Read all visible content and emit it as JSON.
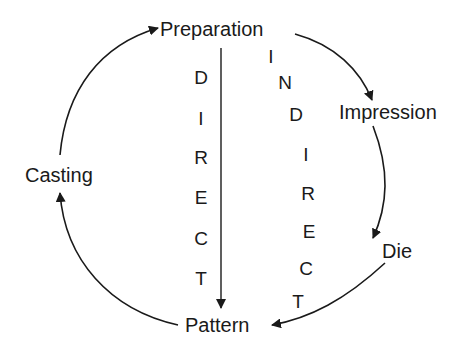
{
  "diagram": {
    "nodes": {
      "preparation": "Preparation",
      "impression": "Impression",
      "die": "Die",
      "pattern": "Pattern",
      "casting": "Casting"
    },
    "direct_path": {
      "label_letters": [
        "D",
        "I",
        "R",
        "E",
        "C",
        "T"
      ],
      "from": "Preparation",
      "to": "Pattern"
    },
    "indirect_path": {
      "label_letters": [
        "I",
        "N",
        "D",
        "I",
        "R",
        "E",
        "C",
        "T"
      ],
      "sequence": [
        "Preparation",
        "Impression",
        "Die",
        "Pattern"
      ]
    },
    "cycle": [
      "Pattern",
      "Casting",
      "Preparation"
    ],
    "colors": {
      "ink": "#1a1a1a",
      "background": "#ffffff"
    }
  }
}
